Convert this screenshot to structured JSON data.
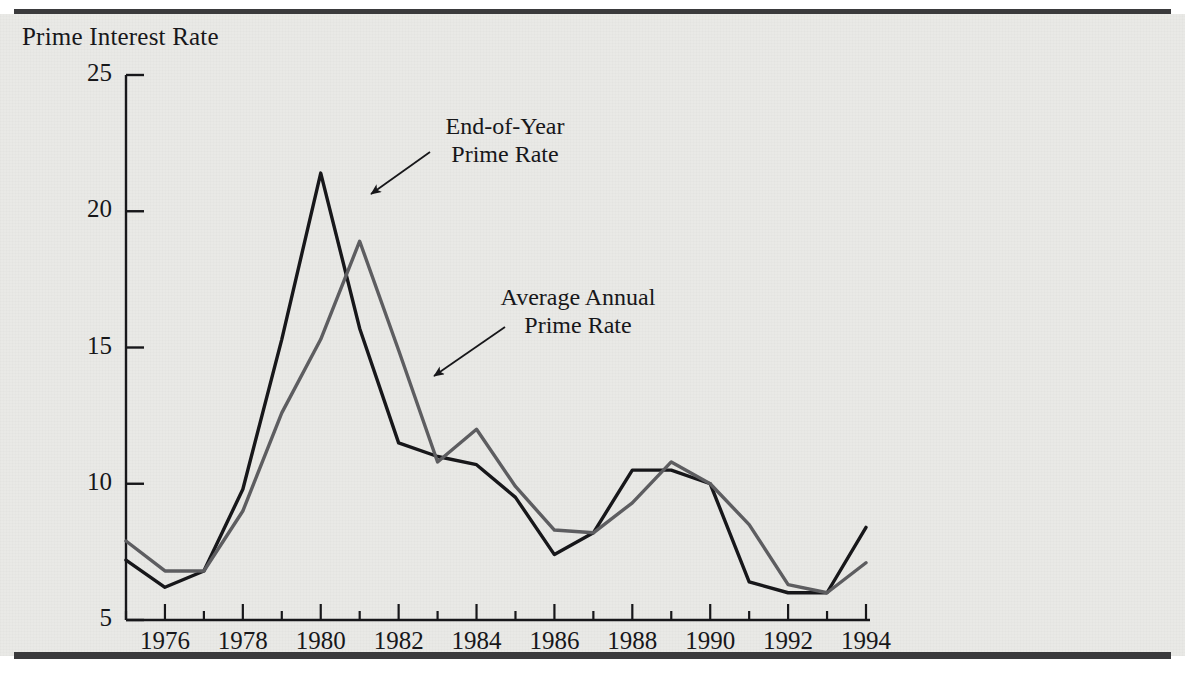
{
  "figure": {
    "title": "Prime Interest Rate",
    "background_color": "#e9e9e6",
    "rule_color": "#3a3a3c"
  },
  "annotations": [
    {
      "name": "end-of-year-annotation",
      "line1": "End-of-Year",
      "line2": "Prime Rate",
      "x": 505,
      "y": 113,
      "arrow_from_x": 430,
      "arrow_from_y": 152,
      "arrow_to_x": 371,
      "arrow_to_y": 194
    },
    {
      "name": "average-annual-annotation",
      "line1": "Average Annual",
      "line2": "Prime Rate",
      "x": 578,
      "y": 284,
      "arrow_from_x": 505,
      "arrow_from_y": 327,
      "arrow_to_x": 434,
      "arrow_to_y": 376
    }
  ],
  "chart_data": {
    "type": "line",
    "title": "Prime Interest Rate",
    "xlabel": "",
    "ylabel": "Prime Interest Rate",
    "xlim": [
      1975,
      1994
    ],
    "ylim": [
      5,
      25
    ],
    "yticks": [
      5,
      10,
      15,
      20,
      25
    ],
    "ytick_labels": [
      "5",
      "10",
      "15",
      "20",
      "25"
    ],
    "xticks": [
      1975,
      1976,
      1977,
      1978,
      1979,
      1980,
      1981,
      1982,
      1983,
      1984,
      1985,
      1986,
      1987,
      1988,
      1989,
      1990,
      1991,
      1992,
      1993,
      1994
    ],
    "xtick_labels_shown": [
      "1976",
      "1978",
      "1980",
      "1982",
      "1984",
      "1986",
      "1988",
      "1990",
      "1992",
      "1994"
    ],
    "xtick_labels_values": [
      1976,
      1978,
      1980,
      1982,
      1984,
      1986,
      1988,
      1990,
      1992,
      1994
    ],
    "grid": false,
    "legend": "annotations",
    "x": [
      1975,
      1976,
      1977,
      1978,
      1979,
      1980,
      1981,
      1982,
      1983,
      1984,
      1985,
      1986,
      1987,
      1988,
      1989,
      1990,
      1991,
      1992,
      1993,
      1994
    ],
    "series": [
      {
        "name": "End-of-Year Prime Rate",
        "color": "#17171a",
        "width": 3.4,
        "values": [
          7.2,
          6.2,
          6.8,
          9.8,
          15.3,
          21.4,
          15.7,
          11.5,
          11.0,
          10.7,
          9.5,
          7.4,
          8.2,
          10.5,
          10.5,
          10.0,
          6.4,
          6.0,
          6.0,
          8.4
        ]
      },
      {
        "name": "Average Annual Prime Rate",
        "color": "#5d5d60",
        "width": 3.4,
        "values": [
          7.9,
          6.8,
          6.8,
          9.0,
          12.6,
          15.3,
          18.9,
          14.9,
          10.8,
          12.0,
          9.9,
          8.3,
          8.2,
          9.3,
          10.8,
          10.0,
          8.5,
          6.3,
          6.0,
          7.1
        ]
      }
    ]
  }
}
